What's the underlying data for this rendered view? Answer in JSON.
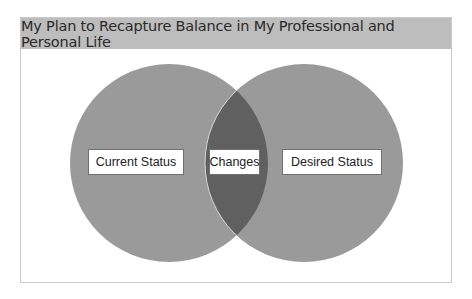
{
  "title": "My Plan to Recapture Balance in My Professional and Personal Life",
  "venn": {
    "left": {
      "label": "Current Status",
      "color": "#9a9a9a"
    },
    "right": {
      "label": "Desired Status",
      "color": "#9a9a9a"
    },
    "overlap": {
      "label": "Changes",
      "color": "#5f5f5f"
    }
  }
}
